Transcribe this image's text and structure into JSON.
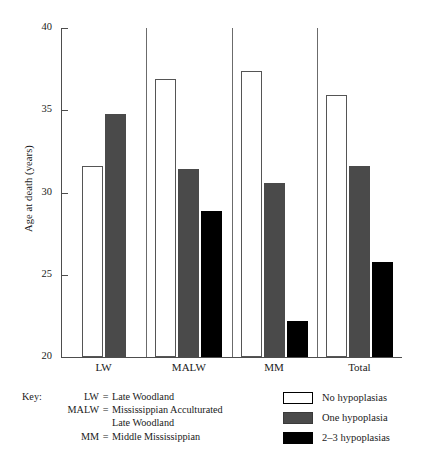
{
  "chart_data": {
    "type": "bar",
    "title": "",
    "xlabel": "",
    "ylabel": "Age at death (years)",
    "ylim": [
      20,
      40
    ],
    "yticks": [
      40,
      35,
      30,
      25,
      20
    ],
    "grid": false,
    "legend_position": "bottom-right",
    "categories": [
      "LW",
      "MALW",
      "MM",
      "Total"
    ],
    "series": [
      {
        "name": "No hypoplasias",
        "color": "#ffffff",
        "values": [
          31.6,
          36.9,
          37.4,
          35.9
        ]
      },
      {
        "name": "One hypoplasia",
        "color": "#4a4a4a",
        "values": [
          34.8,
          31.4,
          30.6,
          31.6
        ]
      },
      {
        "name": "2–3 hypoplasias",
        "color": "#000000",
        "values": [
          null,
          28.9,
          22.2,
          25.8
        ]
      }
    ]
  },
  "axis": {
    "y_title": "Age at death (years)",
    "y_tick_labels": [
      "40",
      "35",
      "30",
      "25",
      "20"
    ],
    "x_tick_labels": [
      "LW",
      "MALW",
      "MM",
      "Total"
    ]
  },
  "key": {
    "lead": "Key:",
    "rows": [
      {
        "abbr": "LW",
        "eq": "=",
        "definition": "Late Woodland"
      },
      {
        "abbr": "MALW",
        "eq": "=",
        "definition": "Mississippian Acculturated"
      },
      {
        "abbr": "",
        "eq": "",
        "definition": "Late Woodland"
      },
      {
        "abbr": "MM",
        "eq": "=",
        "definition": "Middle Mississippian"
      }
    ]
  },
  "legend": {
    "items": [
      {
        "label": "No hypoplasias",
        "swatch": "white"
      },
      {
        "label": "One hypoplasia",
        "swatch": "gray"
      },
      {
        "label": "2–3 hypoplasias",
        "swatch": "black"
      }
    ]
  }
}
